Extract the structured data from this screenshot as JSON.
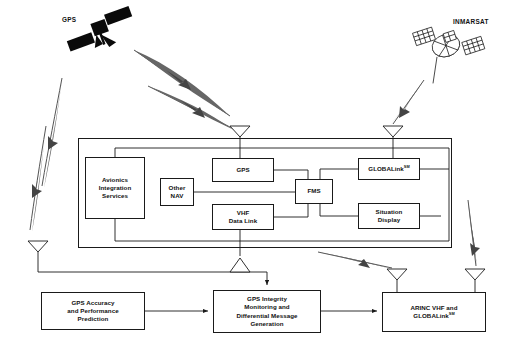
{
  "diagram": {
    "background_color": "#ffffff",
    "line_color": "#1a1a1a"
  },
  "satellites": [
    {
      "id": "gps-satellite",
      "label": "GPS",
      "style": "solid-black",
      "x": 62,
      "y": 28
    },
    {
      "id": "inmarsat-satellite",
      "label": "INMARSAT",
      "style": "mesh-hatched",
      "x": 410,
      "y": 32
    }
  ],
  "avionics_container": {
    "name": "aircraft-avionics-container",
    "x": 78,
    "y": 138,
    "width": 374,
    "height": 110
  },
  "avionics_boxes": [
    {
      "id": "avionics-integration-services",
      "lines": [
        "Avionics",
        "Integration",
        "Services"
      ],
      "x": 85,
      "y": 157,
      "width": 60,
      "height": 62
    },
    {
      "id": "other-nav",
      "lines": [
        "Other",
        "NAV"
      ],
      "x": 160,
      "y": 178,
      "width": 34,
      "height": 28
    },
    {
      "id": "gps-receiver",
      "lines": [
        "GPS"
      ],
      "x": 212,
      "y": 158,
      "width": 62,
      "height": 24
    },
    {
      "id": "vhf-data-link",
      "lines": [
        "VHF",
        "Data Link"
      ],
      "x": 212,
      "y": 204,
      "width": 62,
      "height": 26
    },
    {
      "id": "fms",
      "lines": [
        "FMS"
      ],
      "x": 295,
      "y": 179,
      "width": 38,
      "height": 25
    },
    {
      "id": "globalink-avionics",
      "lines": [
        "GLOBALink"
      ],
      "sup": "SM",
      "x": 358,
      "y": 158,
      "width": 62,
      "height": 22
    },
    {
      "id": "situation-display",
      "lines": [
        "Situation",
        "Display"
      ],
      "x": 358,
      "y": 203,
      "width": 62,
      "height": 26
    }
  ],
  "ground_boxes": [
    {
      "id": "gps-accuracy-performance-prediction",
      "lines": [
        "GPS Accuracy",
        "and Performance",
        "Prediction"
      ],
      "x": 41,
      "y": 292,
      "width": 104,
      "height": 38
    },
    {
      "id": "gps-integrity-monitoring",
      "lines": [
        "GPS Integrity",
        "Monitoring and",
        "Differential Message",
        "Generation"
      ],
      "x": 213,
      "y": 290,
      "width": 108,
      "height": 43
    },
    {
      "id": "arinc-vhf-globalink",
      "lines": [
        "ARINC VHF and",
        "GLOBALink"
      ],
      "sup": "SM",
      "x": 382,
      "y": 292,
      "width": 104,
      "height": 40
    }
  ],
  "antennas": [
    {
      "id": "antenna-aircraft-gps",
      "x": 240,
      "y": 126,
      "direction": "down"
    },
    {
      "id": "antenna-aircraft-satcom",
      "x": 393,
      "y": 126,
      "direction": "down"
    },
    {
      "id": "antenna-ground-gps-reference",
      "x": 38,
      "y": 241,
      "direction": "down"
    },
    {
      "id": "antenna-ground-vhf-uplink",
      "x": 240,
      "y": 256,
      "direction": "up"
    },
    {
      "id": "antenna-arinc-vhf",
      "x": 397,
      "y": 269,
      "direction": "down"
    },
    {
      "id": "antenna-arinc-globalink",
      "x": 475,
      "y": 269,
      "direction": "down"
    }
  ],
  "beams": [
    {
      "id": "beam-gps-to-aircraft-1",
      "from": "gps-satellite",
      "to": "antenna-aircraft-gps"
    },
    {
      "id": "beam-gps-to-aircraft-2",
      "from": "gps-satellite",
      "to": "antenna-aircraft-gps"
    },
    {
      "id": "beam-gps-to-ground-1",
      "from": "gps-satellite",
      "to": "antenna-ground-gps-reference"
    },
    {
      "id": "beam-gps-to-ground-2",
      "from": "gps-satellite",
      "to": "antenna-ground-gps-reference"
    },
    {
      "id": "beam-inmarsat-to-aircraft",
      "from": "inmarsat-satellite",
      "to": "antenna-aircraft-satcom"
    },
    {
      "id": "beam-aircraft-to-arinc-vhf",
      "from": "aircraft",
      "to": "antenna-arinc-vhf"
    },
    {
      "id": "beam-inmarsat-to-arinc-globalink",
      "from": "inmarsat-satellite",
      "to": "antenna-arinc-globalink"
    }
  ],
  "connectors": [
    {
      "id": "link-accuracy-to-integrity",
      "arrow": true
    },
    {
      "id": "link-integrity-to-arinc",
      "arrow": true
    },
    {
      "id": "link-vhf-uplink-to-integrity",
      "arrow": true
    },
    {
      "id": "link-ground-antenna-to-uplink-antenna",
      "arrow": false
    }
  ]
}
